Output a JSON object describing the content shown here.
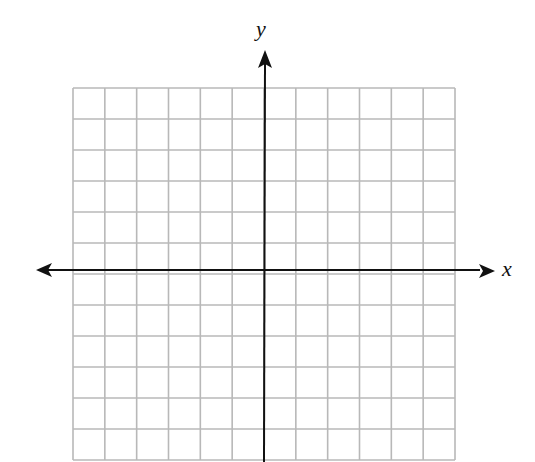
{
  "chart_data": {
    "type": "coordinate-grid",
    "title": "",
    "xlabel": "x",
    "ylabel": "y",
    "grid": true,
    "grid_cells": {
      "columns": 12,
      "rows": 12
    },
    "x_range": [
      -6,
      6
    ],
    "y_range": [
      -6,
      6
    ],
    "tick_labels": [],
    "data_points": [],
    "axis_arrows": {
      "x": "both",
      "y": "up"
    }
  },
  "labels": {
    "x_axis": "x",
    "y_axis": "y"
  },
  "colors": {
    "grid_line": "#b8b8b8",
    "axis": "#111111",
    "background": "#ffffff"
  }
}
